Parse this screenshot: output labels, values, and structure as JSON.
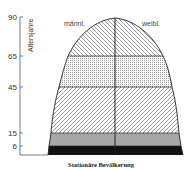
{
  "diagram": {
    "type": "population-pyramid",
    "caption": "Stationäre Bevölkerung",
    "axis": {
      "title": "Altersjahre",
      "ticks": [
        {
          "label": "90",
          "value": 90
        },
        {
          "label": "65",
          "value": 65
        },
        {
          "label": "45",
          "value": 45
        },
        {
          "label": "15",
          "value": 15
        },
        {
          "label": "6",
          "value": 6
        }
      ]
    },
    "sides": {
      "left": "männl.",
      "right": "weibl."
    },
    "bands": [
      {
        "from": 0,
        "to": 6,
        "fill": "solid-black",
        "color": "#111111"
      },
      {
        "from": 6,
        "to": 15,
        "fill": "gray",
        "color": "#a8a8a8"
      },
      {
        "from": 15,
        "to": 45,
        "fill": "hatch-forward-slash",
        "color": "#555555"
      },
      {
        "from": 45,
        "to": 65,
        "fill": "dots",
        "color": "#888888"
      },
      {
        "from": 65,
        "to": 90,
        "fill": "hatch-back-slash",
        "color": "#555555"
      }
    ]
  }
}
